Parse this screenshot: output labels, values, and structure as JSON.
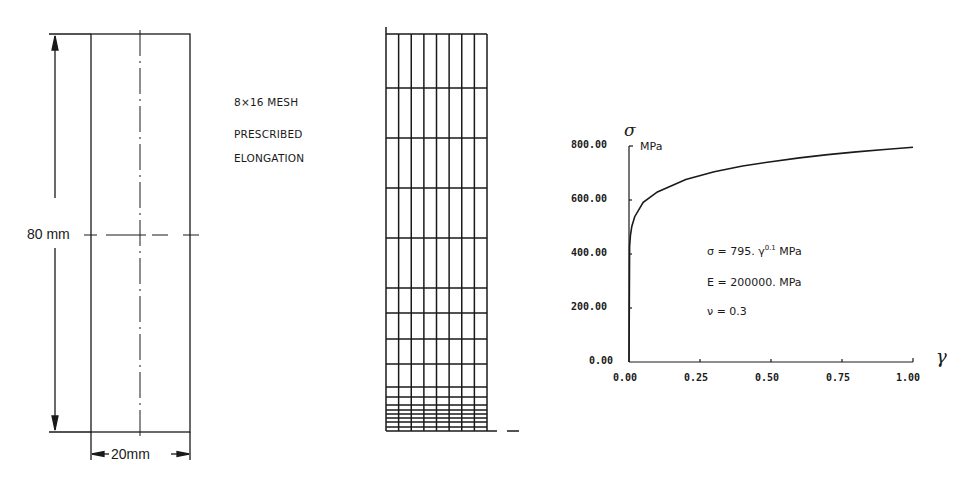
{
  "specimen": {
    "height_label": "80 mm",
    "width_label": "20mm"
  },
  "notes": {
    "mesh": "8×16  MESH",
    "line2": "PRESCRIBED",
    "line3": "ELONGATION"
  },
  "mesh": {
    "columns": 8,
    "rows": 16,
    "x_left": 386,
    "x_right": 487,
    "row_lines_y": [
      34,
      88,
      138,
      188,
      238,
      288,
      313,
      339,
      364,
      387,
      397,
      405,
      410,
      414,
      418,
      422,
      427,
      431
    ]
  },
  "chart": {
    "y_symbol": "σ",
    "x_symbol": "γ",
    "y_unit": "MPa",
    "y_ticks": [
      "800.00",
      "600.00",
      "400.00",
      "200.00",
      "0.00"
    ],
    "x_ticks": [
      "0.00",
      "0.25",
      "0.50",
      "0.75",
      "1.00"
    ],
    "equation_sigma": "σ  =  795.  γ",
    "equation_exp": "0.1",
    "equation_unit": " MPa",
    "equation_E": "E  =  200000.  MPa",
    "equation_nu": "ν  =  0.3"
  },
  "chart_data": {
    "type": "line",
    "title": "",
    "xlabel": "γ",
    "ylabel": "σ (MPa)",
    "xlim": [
      0,
      1.0
    ],
    "ylim": [
      0,
      800
    ],
    "x_ticks": [
      0.0,
      0.25,
      0.5,
      0.75,
      1.0
    ],
    "y_ticks": [
      0,
      200,
      400,
      600,
      800
    ],
    "grid": false,
    "series": [
      {
        "name": "σ = 795 γ^0.1 MPa",
        "x": [
          0.0,
          0.002,
          0.005,
          0.01,
          0.02,
          0.05,
          0.1,
          0.2,
          0.3,
          0.4,
          0.5,
          0.6,
          0.7,
          0.8,
          0.9,
          1.0
        ],
        "values": [
          0,
          428,
          468,
          502,
          538,
          591,
          630,
          676,
          705,
          726,
          742,
          756,
          768,
          778,
          787,
          795
        ]
      }
    ],
    "annotations": [
      "σ = 795. γ^0.1 MPa",
      "E = 200000. MPa",
      "ν = 0.3"
    ]
  }
}
